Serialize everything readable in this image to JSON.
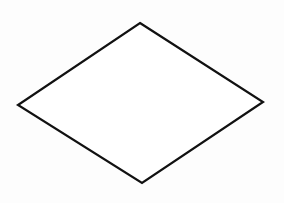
{
  "diagram": {
    "shape": "diamond",
    "stroke_color": "#111111",
    "fill_color": "#ffffff",
    "stroke_width": 2.2,
    "vertices": {
      "top": [
        140,
        23
      ],
      "right": [
        263,
        102
      ],
      "bottom": [
        142,
        183
      ],
      "left": [
        18,
        105
      ]
    }
  }
}
